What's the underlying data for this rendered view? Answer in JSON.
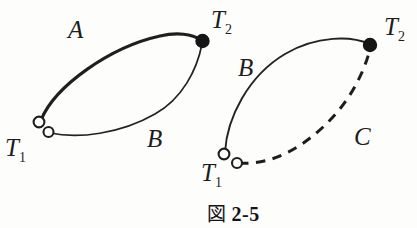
{
  "figure": {
    "caption_kanji": "図",
    "caption_number": "2-5",
    "caption_full": "図 2-5"
  },
  "diagram_left": {
    "name": "left-cycle-diagram",
    "curve_upper_label": "A",
    "curve_lower_label": "B",
    "start_label": "T",
    "start_sub": "1",
    "end_label": "T",
    "end_sub": "2",
    "upper_curve_style": "solid-thick",
    "lower_curve_style": "solid-thin",
    "start_marker": "open-circle-pair",
    "end_marker": "filled-circle"
  },
  "diagram_right": {
    "name": "right-cycle-diagram",
    "curve_upper_label": "B",
    "curve_lower_label": "C",
    "start_label": "T",
    "start_sub": "1",
    "end_label": "T",
    "end_sub": "2",
    "upper_curve_style": "solid-thin",
    "lower_curve_style": "dashed",
    "start_marker": "open-circle-pair",
    "end_marker": "filled-circle"
  },
  "colors": {
    "ink": "#1b1b1b",
    "paper": "#fdfdfc",
    "stroke": "#222222"
  }
}
